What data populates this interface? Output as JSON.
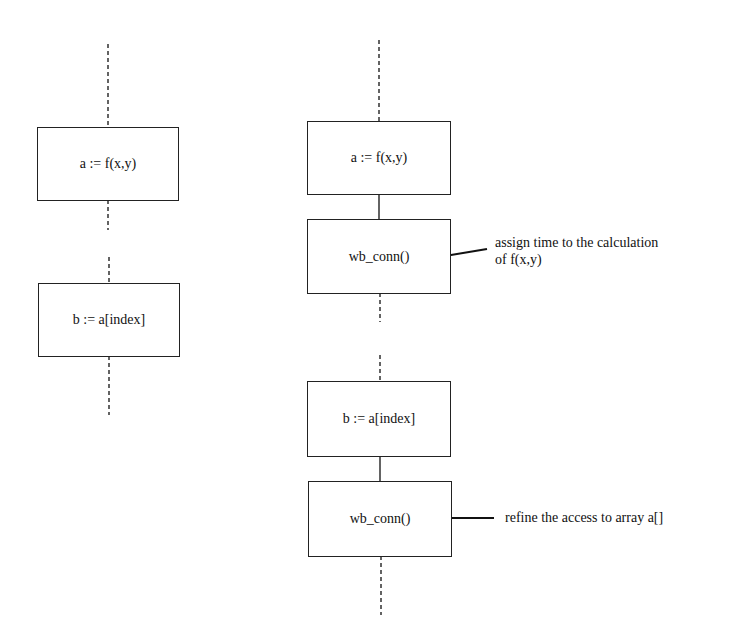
{
  "diagram": {
    "left_column": {
      "boxes": [
        {
          "id": "left-assign-a",
          "text": "a := f(x,y)"
        },
        {
          "id": "left-assign-b",
          "text": "b := a[index]"
        }
      ]
    },
    "right_column": {
      "boxes": [
        {
          "id": "right-assign-a",
          "text": "a := f(x,y)"
        },
        {
          "id": "right-wbconn-1",
          "text": "wb_conn()"
        },
        {
          "id": "right-assign-b",
          "text": "b := a[index]"
        },
        {
          "id": "right-wbconn-2",
          "text": "wb_conn()"
        }
      ]
    },
    "annotations": [
      {
        "line1": "assign time to the calculation",
        "line2": "of f(x,y)"
      },
      {
        "line1": "refine the access to array a[]"
      }
    ],
    "colors": {
      "stroke": "#222222",
      "background": "#ffffff",
      "text": "#111111"
    }
  }
}
